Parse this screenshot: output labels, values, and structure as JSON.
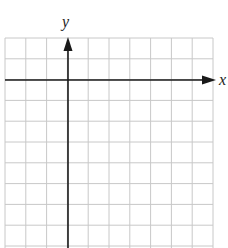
{
  "chart_data": {
    "type": "coordinate-grid",
    "title": "",
    "xlabel": "x",
    "ylabel": "y",
    "grid": true,
    "columns": 10,
    "rows_visible": 10,
    "x_axis_row_from_top": 2,
    "y_axis_column_from_left": 3,
    "tick_labels": [],
    "data_points": []
  },
  "labels": {
    "x_axis": "x",
    "y_axis": "y"
  },
  "colors": {
    "grid": "#c8c8c8",
    "axis": "#1a1a1a",
    "background": "#ffffff"
  }
}
